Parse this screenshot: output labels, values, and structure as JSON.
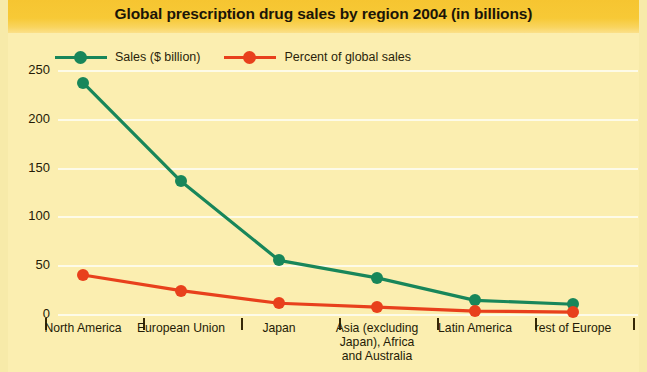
{
  "chart_data": {
    "type": "line",
    "title": "Global prescription drug sales by region 2004 (in billions)",
    "xlabel": "",
    "ylabel": "",
    "ylim": [
      0,
      270
    ],
    "yticks": [
      0,
      50,
      100,
      150,
      200,
      250
    ],
    "ytick_labels": [
      "0",
      "50",
      "100",
      "150",
      "200",
      "250"
    ],
    "grid": true,
    "legend_position": "top-left",
    "categories": [
      "North America",
      "European Union",
      "Japan",
      "Asia (excluding Japan), Africa and Australia",
      "Latin America",
      "rest of Europe"
    ],
    "category_lines": [
      [
        "North America"
      ],
      [
        "European Union"
      ],
      [
        "Japan"
      ],
      [
        "Asia (excluding",
        "Japan), Africa",
        "and Australia"
      ],
      [
        "Latin America"
      ],
      [
        "rest of Europe"
      ]
    ],
    "series": [
      {
        "name": "Sales ($ billion)",
        "color": "#18865a",
        "values": [
          237,
          136,
          55,
          37,
          14,
          10
        ]
      },
      {
        "name": "Percent of global sales",
        "color": "#e8401c",
        "values": [
          40,
          24,
          11,
          7,
          3,
          2
        ]
      }
    ]
  },
  "colors": {
    "banner": "#f6c531",
    "panel": "#fbeeb0",
    "frame": "#f7eaa9",
    "gridline": "#fdfbe8",
    "text": "#241b06",
    "series_green": "#18865a",
    "series_red": "#e8401c"
  }
}
